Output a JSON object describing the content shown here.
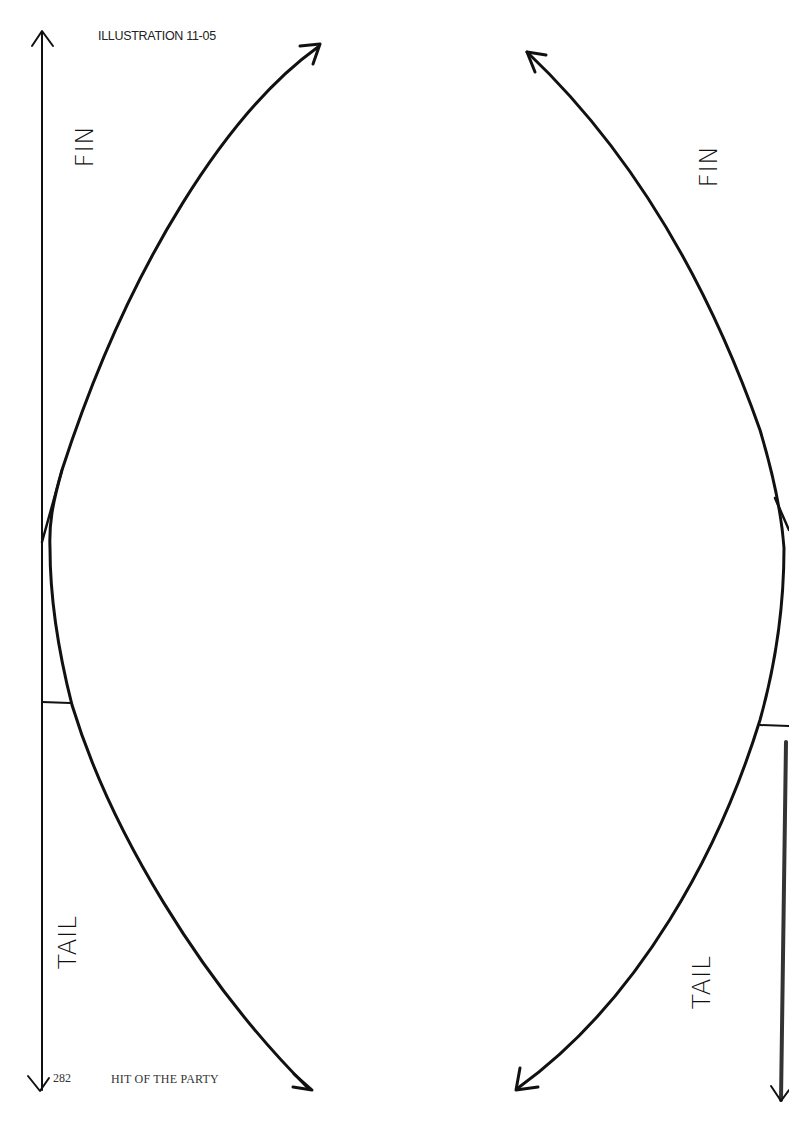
{
  "illustration": {
    "caption": "ILLUSTRATION 11-05",
    "labels": {
      "left_top": "FIN",
      "left_bottom": "TAIL",
      "right_top": "FIN",
      "right_bottom": "TAIL"
    }
  },
  "footer": {
    "page_number": "282",
    "running_title": "HIT OF THE PARTY"
  },
  "colors": {
    "ink": "#111111",
    "paper": "#ffffff"
  }
}
